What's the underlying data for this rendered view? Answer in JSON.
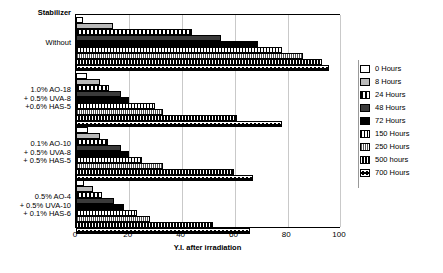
{
  "chart_data": {
    "type": "bar",
    "orientation": "horizontal",
    "title": "",
    "xlabel": "Y.I. after irradiation",
    "ylabel": "Stabilizer",
    "xlim": [
      0,
      100
    ],
    "xticks": [
      0,
      20,
      40,
      60,
      80,
      100
    ],
    "grid": true,
    "legend_position": "right",
    "categories": [
      "Without",
      "1.0% AO-18\n+ 0.5% UVA-8\n+0.6% HAS-5",
      "0.1% AO-10\n+ 0.5% UVA-8\n+ 0.5% HAS-5",
      "0.5% AO-4\n+ 0.5% UVA-10\n+ 0.1% HAS-6"
    ],
    "series": [
      {
        "name": "0 Hours",
        "pattern": "white",
        "values": [
          2.5,
          4.0,
          4.5,
          3.0
        ]
      },
      {
        "name": "8 Hours",
        "pattern": "ltgray",
        "values": [
          14.0,
          9.0,
          9.0,
          6.5
        ]
      },
      {
        "name": "24 Hours",
        "pattern": "dash",
        "values": [
          44.0,
          12.5,
          12.0,
          10.0
        ]
      },
      {
        "name": "48 Hours",
        "pattern": "dkgray",
        "values": [
          55.0,
          17.0,
          17.0,
          14.5
        ]
      },
      {
        "name": "72 Hours",
        "pattern": "black",
        "values": [
          69.0,
          20.0,
          20.0,
          18.0
        ]
      },
      {
        "name": "150 Hours",
        "pattern": "grid1",
        "values": [
          78.0,
          30.0,
          25.0,
          23.0
        ]
      },
      {
        "name": "250 Hours",
        "pattern": "grid2",
        "values": [
          86.0,
          33.0,
          33.0,
          28.0
        ]
      },
      {
        "name": "500 hours",
        "pattern": "dots",
        "values": [
          93.0,
          61.0,
          60.0,
          52.0
        ]
      },
      {
        "name": "700 Hours",
        "pattern": "circles",
        "values": [
          96.0,
          78.0,
          67.0,
          66.0
        ]
      }
    ]
  },
  "axis": {
    "y_title": "Stabilizer",
    "x_title": "Y.I. after irradiation",
    "x_tick_labels": [
      "0",
      "20",
      "40",
      "60",
      "80",
      "100"
    ]
  },
  "legend": {
    "items": [
      {
        "label": "0 Hours"
      },
      {
        "label": "8 Hours"
      },
      {
        "label": "24 Hours"
      },
      {
        "label": "48 Hours"
      },
      {
        "label": "72 Hours"
      },
      {
        "label": "150 Hours"
      },
      {
        "label": "250 Hours"
      },
      {
        "label": "500 hours"
      },
      {
        "label": "700 Hours"
      }
    ]
  },
  "colors": {
    "gridline": "#c9c9c9",
    "axis": "#000000",
    "light_gray_fill": "#b9b9b9",
    "dark_gray_fill": "#3a3a3a",
    "black_fill": "#000000"
  }
}
